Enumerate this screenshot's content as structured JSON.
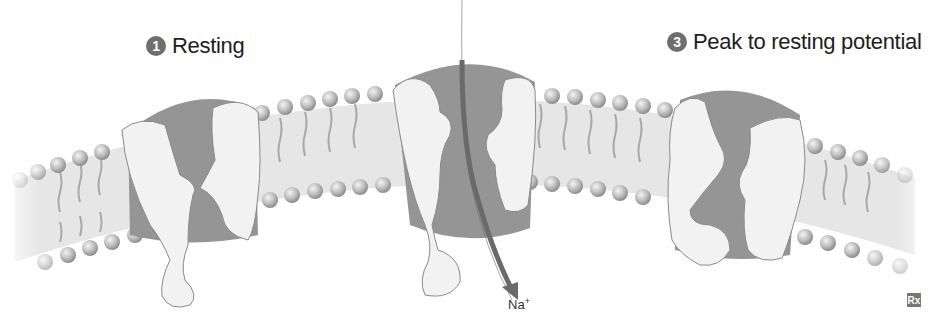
{
  "figure": {
    "states": [
      {
        "number": "1",
        "label": "Resting",
        "gate": "closed"
      },
      {
        "number": "2",
        "label": "",
        "gate": "open"
      },
      {
        "number": "3",
        "label": "Peak to resting potential",
        "gate": "inactivated"
      }
    ],
    "ion_label": "Na",
    "ion_charge": "+",
    "logo": "Rx",
    "colors": {
      "membrane": "#e4e4e4",
      "lipid_head": "#b5b5b5",
      "channel_core": "#8f8f8f",
      "channel_subunit": "#f2f2f2",
      "arrow": "#6a6a6a",
      "badge": "#6e6e6e"
    }
  }
}
